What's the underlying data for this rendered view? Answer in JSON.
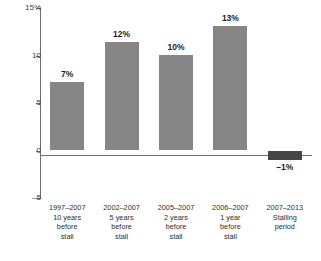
{
  "chart_data": {
    "type": "bar",
    "title": "",
    "subtitle": "",
    "xlabel": "",
    "ylabel": "",
    "ylim": [
      -5,
      15
    ],
    "grid": false,
    "legend": false,
    "y_ticks": [
      {
        "value": 15,
        "label": "15%"
      },
      {
        "value": 10,
        "label": "10"
      },
      {
        "value": 5,
        "label": "5"
      },
      {
        "value": 0,
        "label": "0"
      },
      {
        "value": -5,
        "label": "–5"
      }
    ],
    "categories": [
      "1997–2007\n10 years\nbefore\nstall",
      "2002–2007\n5 years\nbefore\nstall",
      "2005–2007\n2 years\nbefore\nstall",
      "2006–2007\n1 year\nbefore\nstall",
      "2007–2013\nStalling\nperiod"
    ],
    "values": [
      7.2,
      11.4,
      10.1,
      13.1,
      -1.0
    ],
    "data_labels": [
      "7%",
      "12%",
      "10%",
      "13%",
      "–1%"
    ],
    "colors": {
      "positive_bar": "#868686",
      "negative_bar": "#464646",
      "axis": "#6e6e6e",
      "text": "#2e2e2e",
      "background": "#ffffff"
    }
  }
}
